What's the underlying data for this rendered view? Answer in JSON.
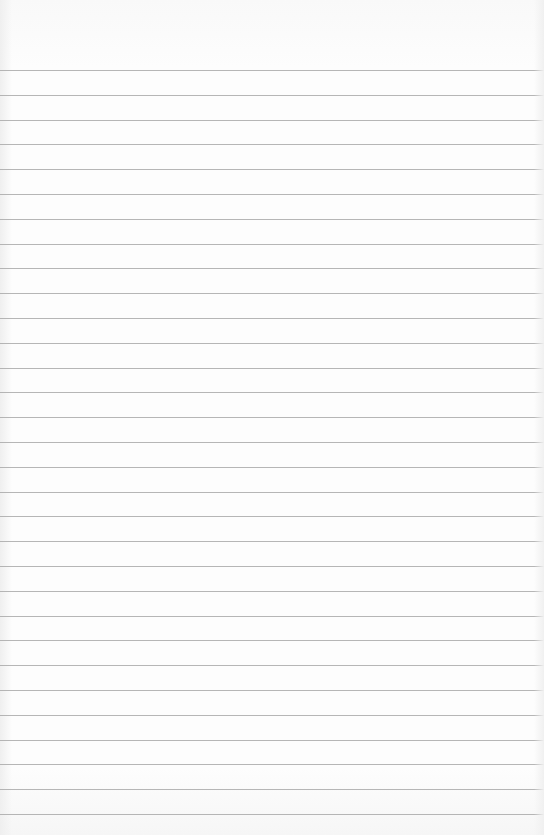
{
  "paper": {
    "kind": "ruled-notebook-paper",
    "line_color": "#a9a9a9",
    "background_color": "#fdfdfd",
    "first_line_y": 70,
    "line_spacing": 24.8,
    "line_count": 31,
    "text": ""
  }
}
